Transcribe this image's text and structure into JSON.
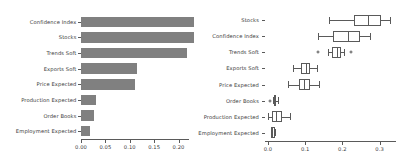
{
  "figure": {
    "background": "#ffffff",
    "bar_color": "#808080",
    "line_color": "#5a5a5a",
    "text_color": "#3a3a3a"
  },
  "chart_data": [
    {
      "type": "bar",
      "orientation": "horizontal",
      "title": "",
      "xlabel": "",
      "ylabel": "",
      "grid": false,
      "legend": "none",
      "xlim": [
        0.0,
        0.2375
      ],
      "xticks": [
        0.0,
        0.05,
        0.1,
        0.15,
        0.2
      ],
      "xticklabels": [
        "0.00",
        "0.05",
        "0.10",
        "0.15",
        "0.20"
      ],
      "categories": [
        "Confidence Index",
        "Stocks",
        "Trends Soft",
        "Exports Soft",
        "Price Expected",
        "Production Expected",
        "Order Books",
        "Employment Expected"
      ],
      "values": [
        0.232,
        0.232,
        0.217,
        0.114,
        0.11,
        0.03,
        0.026,
        0.019
      ]
    },
    {
      "type": "box",
      "orientation": "horizontal",
      "title": "",
      "xlabel": "",
      "ylabel": "",
      "grid": false,
      "legend": "none",
      "xlim": [
        -0.02,
        0.345
      ],
      "xticks": [
        0.0,
        0.1,
        0.2,
        0.3
      ],
      "xticklabels": [
        "0.0",
        "0.1",
        "0.2",
        "0.3"
      ],
      "categories": [
        "Stocks",
        "Confidence Index",
        "Trends Soft",
        "Exports Soft",
        "Price Expected",
        "Order Books",
        "Production Expected",
        "Employment Expected"
      ],
      "boxes": [
        {
          "label": "Stocks",
          "whisker_low": 0.163,
          "q1": 0.232,
          "median": 0.268,
          "q3": 0.305,
          "whisker_high": 0.327,
          "outliers": []
        },
        {
          "label": "Confidence Index",
          "whisker_low": 0.134,
          "q1": 0.176,
          "median": 0.216,
          "q3": 0.248,
          "whisker_high": 0.273,
          "outliers": []
        },
        {
          "label": "Trends Soft",
          "whisker_low": 0.162,
          "q1": 0.173,
          "median": 0.186,
          "q3": 0.197,
          "whisker_high": 0.205,
          "outliers": [
            0.135,
            0.224
          ]
        },
        {
          "label": "Exports Soft",
          "whisker_low": 0.068,
          "q1": 0.089,
          "median": 0.102,
          "q3": 0.113,
          "whisker_high": 0.132,
          "outliers": []
        },
        {
          "label": "Price Expected",
          "whisker_low": 0.054,
          "q1": 0.084,
          "median": 0.097,
          "q3": 0.113,
          "whisker_high": 0.138,
          "outliers": []
        },
        {
          "label": "Order Books",
          "whisker_low": 0.013,
          "q1": 0.016,
          "median": 0.019,
          "q3": 0.022,
          "whisker_high": 0.027,
          "outliers": [
            0.005
          ]
        },
        {
          "label": "Production Expected",
          "whisker_low": 0.0,
          "q1": 0.011,
          "median": 0.022,
          "q3": 0.037,
          "whisker_high": 0.059,
          "outliers": []
        },
        {
          "label": "Employment Expected",
          "whisker_low": 0.008,
          "q1": 0.008,
          "median": 0.011,
          "q3": 0.019,
          "whisker_high": 0.019,
          "outliers": []
        }
      ]
    }
  ]
}
